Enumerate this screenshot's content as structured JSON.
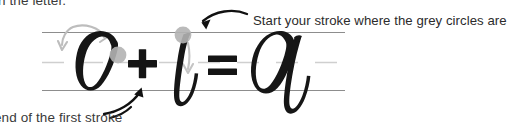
{
  "document": {
    "kind": "calligraphy-stroke-instruction",
    "equation": "O + l = a"
  },
  "annotations": {
    "top_left": "n the letter.",
    "top_right": "Start your stroke where the grey circles are",
    "bottom_left": "end of the first stroke"
  },
  "guides": {
    "ascender_line_label": "top guide line",
    "waist_line_label": "middle dashed guide line",
    "base_line_label": "bottom guide line",
    "line_color": "#8d8d8d",
    "dash_color": "#c9c9c9"
  },
  "equation": {
    "left_letter": "O",
    "plus": "+",
    "middle_letter": "l",
    "equals": "=",
    "result_letter": "a",
    "ink_color": "#171717"
  },
  "markers": {
    "start_circle_color": "#b0b0b0",
    "circles": [
      {
        "label": "start point on O",
        "x": 118,
        "y": 55
      },
      {
        "label": "start point on l",
        "x": 183,
        "y": 35
      }
    ]
  },
  "arrows": {
    "stroke_direction_color": "#b7b7b7",
    "pointer_color": "#1a1a1a",
    "items": [
      {
        "label": "grey direction arrow over O"
      },
      {
        "label": "grey direction arrow down through l"
      },
      {
        "label": "black pointer arrow to start circle"
      },
      {
        "label": "black pointer arrow to end of first stroke"
      }
    ]
  }
}
